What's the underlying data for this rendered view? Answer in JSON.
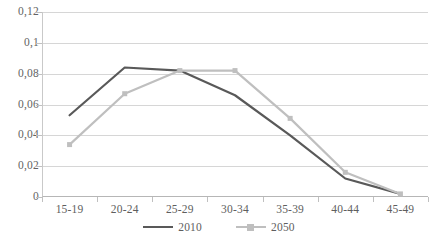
{
  "chart_data": {
    "type": "line",
    "title": "",
    "xlabel": "",
    "ylabel": "",
    "categories": [
      "15-19",
      "20-24",
      "25-29",
      "30-34",
      "35-39",
      "40-44",
      "45-49"
    ],
    "series": [
      {
        "name": "2010",
        "color": "#595959",
        "marker": "none",
        "values": [
          0.053,
          0.084,
          0.082,
          0.066,
          0.04,
          0.012,
          0.002
        ]
      },
      {
        "name": "2050",
        "color": "#bfbfbf",
        "marker": "square",
        "values": [
          0.034,
          0.067,
          0.082,
          0.082,
          0.051,
          0.016,
          0.002
        ]
      }
    ],
    "ylim": [
      0,
      0.12
    ],
    "ytick_values": [
      0,
      0.02,
      0.04,
      0.06,
      0.08,
      0.1,
      0.12
    ],
    "ytick_labels": [
      "0",
      "0,02",
      "0,04",
      "0,06",
      "0,08",
      "0,1",
      "0,12"
    ],
    "grid": "horizontal",
    "legend_position": "bottom-center",
    "decimal_separator": ","
  },
  "legend": {
    "items": [
      {
        "label": "2010",
        "color": "#595959",
        "marker": "none"
      },
      {
        "label": "2050",
        "color": "#bfbfbf",
        "marker": "square"
      }
    ]
  },
  "colors": {
    "series_2010": "#595959",
    "series_2050": "#bfbfbf",
    "gridline": "#d6d6d6",
    "axis": "#b6b6b6",
    "tick_text": "#5e5e5e",
    "background": "#ffffff"
  }
}
